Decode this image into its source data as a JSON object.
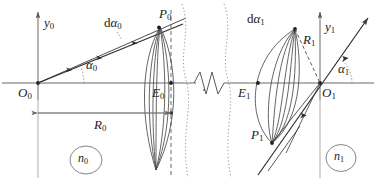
{
  "figure": {
    "type": "optics-ray-diagram",
    "width": 376,
    "height": 181,
    "background": "#ffffff",
    "stroke_color": "#3a3a3a",
    "axis_color": "#555555",
    "dotted_color": "#8a8a8a"
  },
  "labels": {
    "y_axis_left": {
      "base": "y",
      "sub": "0"
    },
    "origin_left": {
      "base": "O",
      "sub": "0"
    },
    "edge_left": {
      "base": "E",
      "sub": "0"
    },
    "point_left": {
      "base": "P",
      "sub": "0"
    },
    "angle_left": {
      "base": "α",
      "sub": "0"
    },
    "dangle_left": {
      "prefix": "d",
      "base": "α",
      "sub": "0"
    },
    "radius_left": {
      "base": "R",
      "sub": "0"
    },
    "index_left": {
      "base": "n",
      "sub": "0"
    },
    "y_axis_right": {
      "base": "y",
      "sub": "1"
    },
    "origin_right": {
      "base": "O",
      "sub": "1"
    },
    "edge_right": {
      "base": "E",
      "sub": "1"
    },
    "point_right": {
      "base": "P",
      "sub": "1"
    },
    "angle_right": {
      "base": "α",
      "sub": "1"
    },
    "dangle_right": {
      "prefix": "d",
      "base": "α",
      "sub": "1"
    },
    "radius_right": {
      "base": "R",
      "sub": "1"
    },
    "index_right": {
      "base": "n",
      "sub": "1"
    }
  },
  "text": {
    "y0": "y0",
    "O0": "O0",
    "E0": "E0",
    "P0": "P0",
    "alpha0": "α0",
    "dalpha0": "dα0",
    "R0": "R0",
    "n0": "n0",
    "y1": "y1",
    "O1": "O1",
    "E1": "E1",
    "P1": "P1",
    "alpha1": "α1",
    "dalpha1": "dα1",
    "R1": "R1",
    "n1": "n1"
  },
  "geometry": {
    "axis_y": 83,
    "origin_left_x": 38,
    "origin_right_x": 320,
    "edge_left_x": 158,
    "edge_right_x": 258,
    "point_left": {
      "x": 158,
      "y": 27
    },
    "point_right": {
      "x": 272,
      "y": 142
    },
    "break_zigzag": {
      "x_start": 193,
      "x_end": 226
    },
    "wavy_line_x": [
      187,
      228
    ]
  }
}
